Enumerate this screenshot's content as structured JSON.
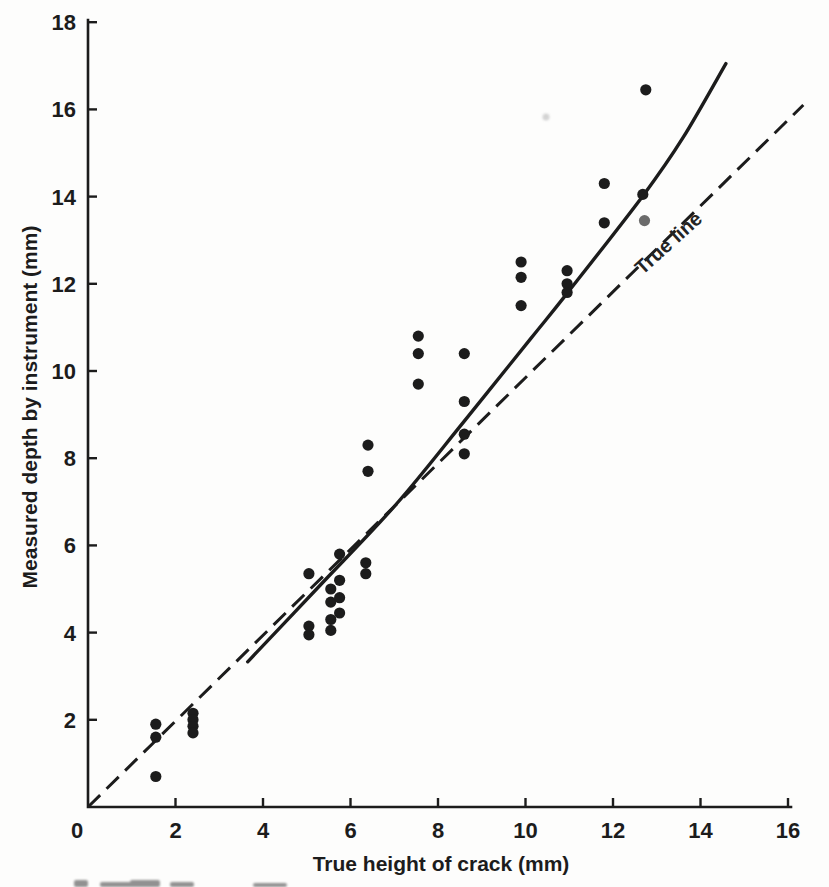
{
  "chart_data": {
    "type": "scatter",
    "title": "",
    "xlabel": "True height of crack (mm)",
    "ylabel": "Measured depth by instrument (mm)",
    "xlim": [
      0,
      16.9
    ],
    "ylim": [
      0,
      18
    ],
    "xticks": [
      0,
      2,
      4,
      6,
      8,
      10,
      12,
      14,
      16
    ],
    "yticks": [
      2,
      4,
      6,
      8,
      10,
      12,
      14,
      16,
      18
    ],
    "grid": false,
    "legend": "none",
    "points": [
      [
        1.55,
        1.9
      ],
      [
        1.55,
        1.6
      ],
      [
        1.55,
        0.7
      ],
      [
        2.4,
        2.15
      ],
      [
        2.4,
        2.0
      ],
      [
        2.4,
        1.85
      ],
      [
        2.4,
        1.7
      ],
      [
        5.05,
        5.35
      ],
      [
        5.05,
        4.15
      ],
      [
        5.05,
        3.95
      ],
      [
        5.55,
        5.0
      ],
      [
        5.55,
        4.7
      ],
      [
        5.55,
        4.3
      ],
      [
        5.55,
        4.05
      ],
      [
        5.75,
        5.8
      ],
      [
        5.75,
        5.2
      ],
      [
        5.75,
        4.8
      ],
      [
        5.75,
        4.45
      ],
      [
        6.35,
        5.6
      ],
      [
        6.35,
        5.35
      ],
      [
        6.4,
        8.3
      ],
      [
        6.4,
        7.7
      ],
      [
        7.55,
        10.8
      ],
      [
        7.55,
        10.4
      ],
      [
        7.55,
        9.7
      ],
      [
        8.6,
        10.4
      ],
      [
        8.6,
        9.3
      ],
      [
        8.6,
        8.55
      ],
      [
        8.6,
        8.1
      ],
      [
        9.9,
        12.5
      ],
      [
        9.9,
        12.15
      ],
      [
        9.9,
        11.5
      ],
      [
        10.95,
        12.3
      ],
      [
        10.95,
        12.0
      ],
      [
        10.95,
        11.8
      ],
      [
        11.8,
        14.3
      ],
      [
        11.8,
        13.4
      ],
      [
        12.68,
        14.05
      ],
      [
        12.75,
        16.45
      ]
    ],
    "faded_points": [
      [
        12.72,
        13.45
      ]
    ],
    "reference_line": {
      "label": "True line",
      "style": "dashed",
      "from": [
        0,
        0
      ],
      "to": [
        16.35,
        16.1
      ]
    },
    "fitted_curve": {
      "style": "solid",
      "points": [
        [
          3.65,
          3.33
        ],
        [
          5.3,
          5.08
        ],
        [
          7.05,
          6.95
        ],
        [
          8.6,
          8.85
        ],
        [
          10.1,
          10.72
        ],
        [
          10.95,
          11.78
        ],
        [
          12.7,
          14.04
        ],
        [
          13.6,
          15.35
        ],
        [
          14.58,
          17.05
        ]
      ]
    },
    "point_radius_px": 5.6,
    "colors": {
      "ink": "#1c1c1c",
      "faded_point": "#6b6b6b",
      "background": "#fdfdfc"
    }
  }
}
